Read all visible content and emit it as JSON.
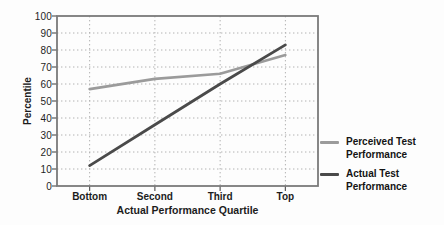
{
  "figure": {
    "background": "#fdfdfd"
  },
  "chart_data": {
    "type": "line",
    "title": "",
    "xlabel": "Actual Performance Quartile",
    "ylabel": "Percentile",
    "categories": [
      "Bottom",
      "Second",
      "Third",
      "Top"
    ],
    "series": [
      {
        "name": "Perceived Test Performance",
        "values": [
          57,
          63,
          66,
          77
        ],
        "color": "#9b9b9b",
        "stroke_width": 2.6
      },
      {
        "name": "Actual Test Performance",
        "values": [
          12,
          36,
          60,
          83
        ],
        "color": "#4a4a4a",
        "stroke_width": 2.8
      }
    ],
    "ylim": [
      0,
      100
    ],
    "yticks": [
      100,
      90,
      80,
      70,
      60,
      50,
      40,
      30,
      20,
      10,
      0
    ],
    "grid": "dotted",
    "grid_color": "#b2b2b2",
    "frame_color": "#7a7a7a",
    "tick_color": "#5a5a5a",
    "legend_position": "right"
  }
}
